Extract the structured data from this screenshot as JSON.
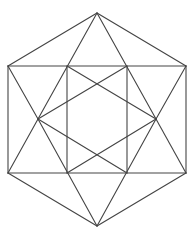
{
  "figure": {
    "width": 195,
    "height": 235,
    "background": "#ffffff",
    "stroke_color": "#444444",
    "stroke_width": 1.1,
    "vertices": {
      "top": [
        97,
        13
      ],
      "upper_left": [
        8,
        66
      ],
      "upper_right": [
        186,
        66
      ],
      "lower_left": [
        8,
        173
      ],
      "lower_right": [
        186,
        173
      ],
      "bottom": [
        97,
        226
      ],
      "mid_left": [
        38,
        119
      ],
      "mid_right": [
        156,
        119
      ],
      "sq_top_left": [
        67,
        66
      ],
      "sq_top_right": [
        127,
        66
      ],
      "sq_bottom_left": [
        67,
        173
      ],
      "sq_bottom_right": [
        127,
        173
      ]
    },
    "segments": [
      {
        "name": "hex-edge-top-left",
        "from": "top",
        "to": "upper_left"
      },
      {
        "name": "hex-edge-top-right",
        "from": "top",
        "to": "upper_right"
      },
      {
        "name": "hex-edge-left",
        "from": "upper_left",
        "to": "lower_left"
      },
      {
        "name": "hex-edge-right",
        "from": "upper_right",
        "to": "lower_right"
      },
      {
        "name": "hex-edge-bottom-left",
        "from": "lower_left",
        "to": "bottom"
      },
      {
        "name": "hex-edge-bottom-right",
        "from": "lower_right",
        "to": "bottom"
      },
      {
        "name": "horizontal-upper",
        "from": "upper_left",
        "to": "upper_right"
      },
      {
        "name": "horizontal-lower",
        "from": "lower_left",
        "to": "lower_right"
      },
      {
        "name": "square-left",
        "from": "sq_top_left",
        "to": "sq_bottom_left"
      },
      {
        "name": "square-right",
        "from": "sq_top_right",
        "to": "sq_bottom_right"
      },
      {
        "name": "top-to-mid-left",
        "from": "top",
        "to": "mid_left"
      },
      {
        "name": "top-to-mid-right",
        "from": "top",
        "to": "mid_right"
      },
      {
        "name": "bottom-to-mid-left",
        "from": "bottom",
        "to": "mid_left"
      },
      {
        "name": "bottom-to-mid-right",
        "from": "bottom",
        "to": "mid_right"
      },
      {
        "name": "upper-left-to-mid-left",
        "from": "upper_left",
        "to": "mid_left"
      },
      {
        "name": "lower-left-to-mid-left",
        "from": "lower_left",
        "to": "mid_left"
      },
      {
        "name": "upper-right-to-mid-right",
        "from": "upper_right",
        "to": "mid_right"
      },
      {
        "name": "lower-right-to-mid-right",
        "from": "lower_right",
        "to": "mid_right"
      },
      {
        "name": "mid-left-to-sq-top-right",
        "from": "mid_left",
        "to": "sq_top_right"
      },
      {
        "name": "mid-left-to-sq-bottom-right",
        "from": "mid_left",
        "to": "sq_bottom_right"
      },
      {
        "name": "mid-right-to-sq-top-left",
        "from": "mid_right",
        "to": "sq_top_left"
      },
      {
        "name": "mid-right-to-sq-bottom-left",
        "from": "mid_right",
        "to": "sq_bottom_left"
      }
    ]
  }
}
